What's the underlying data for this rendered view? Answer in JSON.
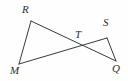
{
  "figure": {
    "background_color": "#fefefe",
    "stroke_color": "#3a3a3a",
    "label_color": "#2e2e2e",
    "points": [
      {
        "name": "R",
        "label": "R",
        "x": 31,
        "y": 21,
        "label_x": 22,
        "label_y": 4
      },
      {
        "name": "M",
        "label": "M",
        "x": 19,
        "y": 64,
        "label_x": 10,
        "label_y": 65
      },
      {
        "name": "T",
        "label": "T",
        "x": 79,
        "y": 46,
        "label_x": 75,
        "label_y": 29
      },
      {
        "name": "S",
        "label": "S",
        "x": 107,
        "y": 38,
        "label_x": 103,
        "label_y": 17
      },
      {
        "name": "Q",
        "label": "Q",
        "x": 116,
        "y": 61,
        "label_x": 112,
        "label_y": 63
      }
    ],
    "segments": [
      {
        "name": "segment-RM",
        "from": "R",
        "to": "M"
      },
      {
        "name": "segment-RQ",
        "from": "R",
        "to": "Q"
      },
      {
        "name": "segment-MS",
        "from": "M",
        "to": "S"
      },
      {
        "name": "segment-SQ",
        "from": "S",
        "to": "Q"
      }
    ]
  }
}
